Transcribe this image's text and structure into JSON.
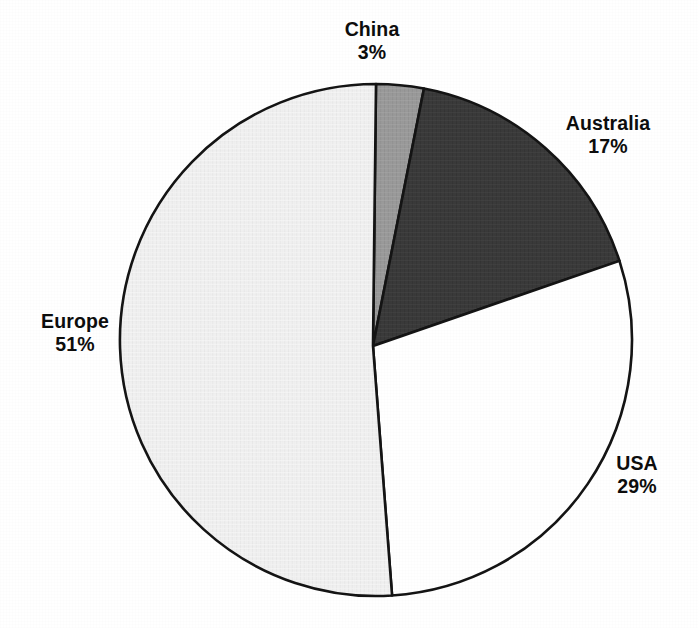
{
  "chart_data": {
    "type": "pie",
    "title": "",
    "labels": [
      "China",
      "Australia",
      "USA",
      "Europe"
    ],
    "values": [
      3,
      17,
      29,
      51
    ],
    "value_suffix": "%",
    "unit": "percent",
    "legend": "none",
    "grid": false,
    "start_angle_deg": 0,
    "direction": "clockwise",
    "slices": [
      {
        "label": "China",
        "value": 3,
        "value_text": "3%",
        "color": "#9a9a9a",
        "label_position": "top"
      },
      {
        "label": "Australia",
        "value": 17,
        "value_text": "17%",
        "color": "#3a3a3a",
        "label_position": "right-upper"
      },
      {
        "label": "USA",
        "value": 29,
        "value_text": "29%",
        "color": "#ffffff",
        "label_position": "right-lower"
      },
      {
        "label": "Europe",
        "value": 51,
        "value_text": "51%",
        "color": "#f0f0f0",
        "label_position": "left"
      }
    ]
  },
  "geometry": {
    "center_x": 376,
    "center_y": 340,
    "radius": 256,
    "stroke_color": "#141414",
    "stroke_width": 2.6
  },
  "labels": {
    "china": {
      "name": "China",
      "value": "3%"
    },
    "australia": {
      "name": "Australia",
      "value": "17%"
    },
    "usa": {
      "name": "USA",
      "value": "29%"
    },
    "europe": {
      "name": "Europe",
      "value": "51%"
    }
  },
  "colors": {
    "china": "#9a9a9a",
    "australia": "#3a3a3a",
    "usa": "#ffffff",
    "europe": "#f0f0f0",
    "outline": "#141414",
    "text": "#0d0d0d",
    "background": "#ffffff"
  }
}
